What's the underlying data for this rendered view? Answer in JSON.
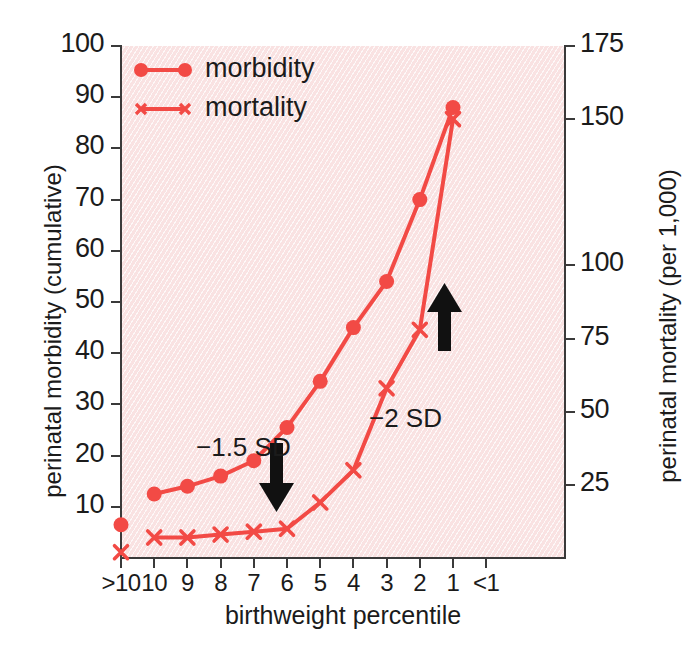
{
  "figure": {
    "background_color": "#fbecec",
    "series_color": "#f24a45",
    "axis_color": "#3a3a3a",
    "arrow_color": "#111111"
  },
  "legend": {
    "position": "top-left-inside",
    "entries": [
      {
        "label": "morbidity",
        "marker": "circle",
        "icon": "legend-line-circle-icon"
      },
      {
        "label": "mortality",
        "marker": "x",
        "icon": "legend-line-x-icon"
      }
    ]
  },
  "annotations": [
    {
      "id": "sd15",
      "text": "−1.5 SD",
      "arrow": "down",
      "at_category": "7"
    },
    {
      "id": "sd2",
      "text": "−2 SD",
      "arrow": "up",
      "at_category": "2"
    }
  ],
  "chart_data": {
    "type": "line",
    "title": "",
    "xlabel": "birthweight percentile",
    "ylabel": "perinatal morbidity  (cumulative)",
    "y2label": "perinatal mortality  (per 1,000)",
    "categories": [
      ">10",
      "10",
      "9",
      "8",
      "7",
      "6",
      "5",
      "4",
      "3",
      "2",
      "1",
      "<1"
    ],
    "xtick_labels": [
      ">10",
      "10",
      "9",
      "8",
      "7",
      "6",
      "5",
      "4",
      "3",
      "2",
      "1",
      "<1"
    ],
    "ylim": [
      0,
      100
    ],
    "ytick_labels": [
      "100",
      "90",
      "80",
      "70",
      "60",
      "50",
      "40",
      "30",
      "20",
      "10"
    ],
    "yticks": [
      100,
      90,
      80,
      70,
      60,
      50,
      40,
      30,
      20,
      10
    ],
    "y2lim": [
      0,
      175
    ],
    "y2tick_labels": [
      "175",
      "150",
      "100",
      "75",
      "50",
      "25"
    ],
    "y2ticks": [
      175,
      150,
      100,
      75,
      50,
      25
    ],
    "grid": false,
    "series": [
      {
        "name": "morbidity",
        "axis": "left",
        "units": "cumulative %",
        "marker": "circle",
        "color": "#f24a45",
        "x": [
          ">10",
          "10",
          "9",
          "8",
          "7",
          "6",
          "5",
          "4",
          "3",
          "2",
          "1"
        ],
        "values": [
          6.5,
          12.5,
          14,
          16,
          19,
          25.5,
          34.5,
          45,
          54,
          70,
          88
        ],
        "connected_from_index": 1
      },
      {
        "name": "mortality",
        "axis": "right",
        "units": "per 1,000",
        "marker": "x",
        "color": "#f24a45",
        "x": [
          ">10",
          "10",
          "9",
          "8",
          "7",
          "6",
          "5",
          "4",
          "3",
          "2",
          "1"
        ],
        "values": [
          2,
          7,
          7,
          8,
          9,
          10,
          19,
          30,
          58,
          78,
          150
        ],
        "connected_from_index": 1
      }
    ]
  }
}
